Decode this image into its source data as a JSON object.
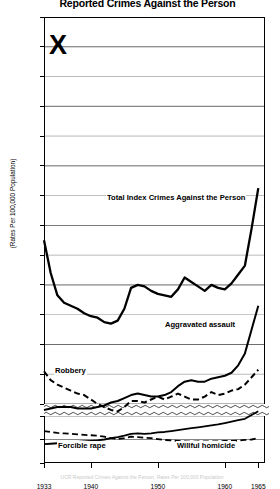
{
  "title": "Reported Crimes Against the Person",
  "axis": {
    "ylabel": "(Rates Per 100,000 Population)",
    "yticks_upper": [
      300,
      280,
      260,
      240,
      220,
      200,
      180,
      160,
      140,
      120,
      100,
      80,
      60,
      40
    ],
    "yticks_upper_labeled": [
      300,
      200,
      180,
      160,
      140,
      120,
      100,
      80,
      60,
      40
    ],
    "yticks_lower": [
      10,
      5,
      0
    ],
    "xticks": [
      1933,
      1940,
      1950,
      1960,
      1965
    ]
  },
  "annotation": {
    "mark": "X"
  },
  "footer": "UCR Reported Crimes Against the Person, Rates Per 100,000 Population",
  "series_labels": {
    "total": "Total Index Crimes Against the Person",
    "assault": "Aggravated assault",
    "robbery": "Robbery",
    "rape": "Forcible rape",
    "homicide": "Willful homicide"
  },
  "chart_data": {
    "type": "line",
    "title": "Reported Crimes Against the Person",
    "xlabel": "",
    "ylabel": "(Rates Per 100,000 Population)",
    "xlim": [
      1933,
      1966
    ],
    "ylim_upper": [
      40,
      300
    ],
    "ylim_lower": [
      0,
      10
    ],
    "broken_axis": true,
    "grid": true,
    "legend": "inline-annotations",
    "x": [
      1933,
      1934,
      1935,
      1936,
      1937,
      1938,
      1939,
      1940,
      1941,
      1942,
      1943,
      1944,
      1945,
      1946,
      1947,
      1948,
      1949,
      1950,
      1951,
      1952,
      1953,
      1954,
      1955,
      1956,
      1957,
      1958,
      1959,
      1960,
      1961,
      1962,
      1963,
      1964,
      1965
    ],
    "series": [
      {
        "name": "Total Index Crimes Against the Person",
        "style": "solid",
        "scale": "upper",
        "values": [
          150,
          128,
          113,
          108,
          106,
          104,
          101,
          99,
          98,
          95,
          94,
          96,
          104,
          118,
          120,
          119,
          116,
          114,
          113,
          112,
          117,
          125,
          122,
          119,
          116,
          120,
          118,
          117,
          121,
          127,
          133,
          158,
          185
        ]
      },
      {
        "name": "Aggravated assault",
        "style": "solid",
        "scale": "upper",
        "values": [
          36,
          37,
          38,
          38,
          38,
          37,
          37,
          37,
          38,
          39,
          41,
          42,
          44,
          46,
          47,
          46,
          45,
          45,
          46,
          48,
          52,
          55,
          56,
          55,
          55,
          57,
          58,
          59,
          61,
          66,
          74,
          90,
          106
        ]
      },
      {
        "name": "Robbery",
        "style": "dashed",
        "scale": "upper",
        "values": [
          62,
          56,
          53,
          51,
          49,
          47,
          46,
          43,
          40,
          38,
          36,
          35,
          38,
          42,
          42,
          41,
          43,
          45,
          43,
          45,
          47,
          45,
          43,
          43,
          45,
          48,
          46,
          47,
          49,
          50,
          53,
          58,
          63
        ]
      },
      {
        "name": "Forcible rape",
        "style": "solid",
        "scale": "lower",
        "values": [
          4.0,
          4.1,
          4.2,
          4.3,
          4.4,
          4.5,
          4.6,
          4.7,
          4.8,
          5.0,
          5.3,
          5.5,
          5.8,
          6.2,
          6.3,
          6.2,
          6.3,
          6.5,
          6.6,
          6.8,
          7.0,
          7.2,
          7.4,
          7.6,
          7.8,
          8.0,
          8.2,
          8.5,
          8.8,
          9.1,
          9.4,
          10.2,
          11.0
        ]
      },
      {
        "name": "Willful homicide",
        "style": "dashed",
        "scale": "lower",
        "values": [
          6.8,
          6.6,
          6.4,
          6.3,
          6.2,
          6.1,
          6.0,
          5.9,
          5.8,
          5.6,
          5.3,
          5.1,
          5.3,
          5.6,
          5.5,
          5.4,
          5.3,
          5.1,
          4.9,
          4.8,
          4.7,
          4.6,
          4.5,
          4.6,
          4.6,
          4.6,
          4.6,
          4.7,
          4.7,
          4.8,
          4.9,
          5.0,
          5.3
        ]
      }
    ]
  }
}
